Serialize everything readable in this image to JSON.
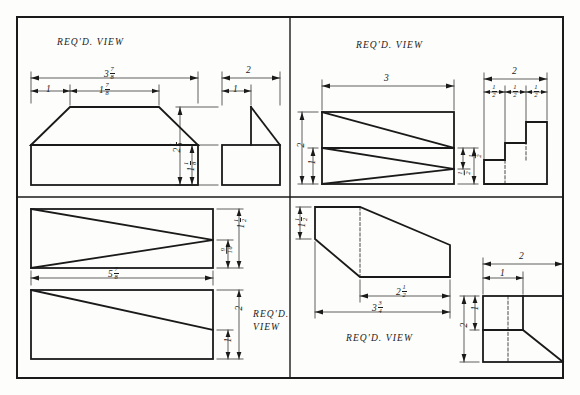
{
  "sheet": {
    "title": "Engineering Drawing Worksheet — Four Isometric Problems",
    "background_color": "#fdfdfb",
    "line_color": "#1a1a1a",
    "border_color": "#1a1a1a"
  },
  "panels": [
    {
      "id": "top-left",
      "view_label": "REQ'D. VIEW",
      "dimensions": [
        {
          "name": "overall-width",
          "whole": "3",
          "num": "7",
          "den": "8"
        },
        {
          "name": "left-offset",
          "whole": "1",
          "num": "",
          "den": ""
        },
        {
          "name": "top-face-width",
          "whole": "1",
          "num": "7",
          "den": "8"
        },
        {
          "name": "side-width",
          "whole": "2",
          "num": "",
          "den": ""
        },
        {
          "name": "side-offset",
          "whole": "1",
          "num": "",
          "den": ""
        },
        {
          "name": "overall-height",
          "whole": "2",
          "num": "1",
          "den": "8"
        },
        {
          "name": "base-height",
          "whole": "1",
          "num": "1",
          "den": "8"
        }
      ]
    },
    {
      "id": "top-right",
      "view_label": "REQ'D. VIEW",
      "dimensions": [
        {
          "name": "overall-length",
          "whole": "3",
          "num": "",
          "den": ""
        },
        {
          "name": "overall-height",
          "whole": "2",
          "num": "",
          "den": ""
        },
        {
          "name": "mid-height",
          "whole": "1",
          "num": "",
          "den": ""
        },
        {
          "name": "right-upper-height",
          "whole": "",
          "num": "1",
          "den": "2"
        },
        {
          "name": "right-lower-height",
          "whole": "",
          "num": "1",
          "den": "2"
        },
        {
          "name": "step-total-width",
          "whole": "2",
          "num": "",
          "den": ""
        },
        {
          "name": "step-1-width",
          "whole": "",
          "num": "1",
          "den": "2"
        },
        {
          "name": "step-2-width",
          "whole": "",
          "num": "1",
          "den": "2"
        },
        {
          "name": "step-3-width",
          "whole": "",
          "num": "1",
          "den": "2"
        }
      ]
    },
    {
      "id": "bottom-left",
      "view_label_line1": "REQ'D.",
      "view_label_line2": "VIEW",
      "dimensions": [
        {
          "name": "overall-length",
          "whole": "5",
          "num": "7",
          "den": "8"
        },
        {
          "name": "upper-top-height",
          "whole": "1",
          "num": "1",
          "den": "2"
        },
        {
          "name": "upper-bottom-height",
          "whole": "",
          "num": "9",
          "den": "16"
        },
        {
          "name": "lower-overall-height",
          "whole": "2",
          "num": "",
          "den": ""
        },
        {
          "name": "lower-inner-height",
          "whole": "1",
          "num": "",
          "den": ""
        }
      ]
    },
    {
      "id": "bottom-right",
      "view_label": "REQ'D. VIEW",
      "dimensions": [
        {
          "name": "front-height",
          "whole": "1",
          "num": "1",
          "den": "2"
        },
        {
          "name": "upper-length",
          "whole": "2",
          "num": "1",
          "den": "2"
        },
        {
          "name": "overall-length",
          "whole": "3",
          "num": "3",
          "den": "4"
        },
        {
          "name": "side-width",
          "whole": "2",
          "num": "",
          "den": ""
        },
        {
          "name": "side-inner-width",
          "whole": "1",
          "num": "",
          "den": ""
        },
        {
          "name": "side-overall-height",
          "whole": "2",
          "num": "",
          "den": ""
        },
        {
          "name": "side-inner-height",
          "whole": "1",
          "num": "",
          "den": ""
        }
      ]
    }
  ]
}
